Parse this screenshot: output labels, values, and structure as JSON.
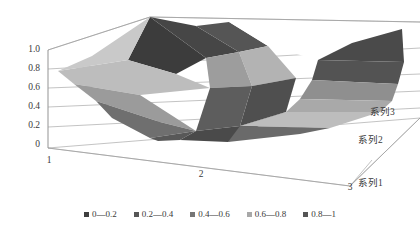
{
  "chart_data": {
    "type": "surface",
    "title": "",
    "xlabel": "",
    "ylabel": "",
    "zlabel": "",
    "grid": true,
    "legend_position": "bottom",
    "categories": [
      "1",
      "2",
      "3"
    ],
    "series_names": [
      "系列1",
      "系列2",
      "系列3"
    ],
    "zlim": [
      0,
      1
    ],
    "z_ticks": [
      "0",
      "0.2",
      "0.4",
      "0.6",
      "0.8",
      "1.0"
    ],
    "series": [
      {
        "name": "系列1",
        "values": [
          0.85,
          0.1,
          0.95
        ]
      },
      {
        "name": "系列2",
        "values": [
          0.8,
          0.55,
          0.45
        ]
      },
      {
        "name": "系列3",
        "values": [
          0.82,
          1.0,
          0.3
        ]
      }
    ],
    "color_bands": [
      {
        "label": "0—0.2",
        "range": [
          0,
          0.2
        ],
        "color": "#404040"
      },
      {
        "label": "0.2—0.4",
        "range": [
          0.2,
          0.4
        ],
        "color": "#595959"
      },
      {
        "label": "0.4—0.6",
        "range": [
          0.4,
          0.6
        ],
        "color": "#7f7f7f"
      },
      {
        "label": "0.6—0.8",
        "range": [
          0.6,
          0.8
        ],
        "color": "#a6a6a6"
      },
      {
        "label": "0.8—1",
        "range": [
          0.8,
          1.0
        ],
        "color": "#595959"
      }
    ]
  },
  "axes": {
    "z_axis": {
      "name": "value-axis",
      "ticks": [
        {
          "label": "1.0",
          "x": 40,
          "y": 52
        },
        {
          "label": "0.8",
          "x": 40,
          "y": 71
        },
        {
          "label": "0.6",
          "x": 40,
          "y": 90
        },
        {
          "label": "0.4",
          "x": 40,
          "y": 109
        },
        {
          "label": "0.2",
          "x": 40,
          "y": 128
        },
        {
          "label": "0",
          "x": 40,
          "y": 147
        }
      ]
    },
    "x_axis": {
      "name": "category-axis",
      "ticks": [
        {
          "label": "1",
          "x": 49,
          "y": 163
        },
        {
          "label": "2",
          "x": 201,
          "y": 177
        },
        {
          "label": "3",
          "x": 350,
          "y": 190
        }
      ]
    },
    "depth_axis": {
      "name": "series-axis",
      "ticks": [
        {
          "label": "系列3",
          "x": 370,
          "y": 115
        },
        {
          "label": "系列2",
          "x": 358,
          "y": 143
        },
        {
          "label": "系列1",
          "x": 358,
          "y": 186
        }
      ]
    }
  },
  "legend": {
    "items": [
      {
        "label": "0—0.2",
        "color": "#3f3f3f"
      },
      {
        "label": "0.2—0.4",
        "color": "#565656"
      },
      {
        "label": "0.4—0.6",
        "color": "#767676"
      },
      {
        "label": "0.6—0.8",
        "color": "#a8a8a8"
      },
      {
        "label": "0.8—1",
        "color": "#555555"
      }
    ]
  },
  "surface_facets": [
    {
      "name": "facet-back-peak-dark",
      "points": "150,17 206,58 176,74 128,60",
      "color": "#3c3c3c"
    },
    {
      "name": "facet-back-peak-dark2",
      "points": "150,17 206,58 239,52 196,26",
      "color": "#464646"
    },
    {
      "name": "facet-back-upper-mid",
      "points": "196,26 239,52 268,46 229,22",
      "color": "#555555"
    },
    {
      "name": "facet-back-right-top",
      "points": "229,22 268,46 318,60 352,43",
      "color": "#ffffff"
    },
    {
      "name": "facet-right-dark-wedge",
      "points": "318,60 352,43 402,29 404,62",
      "color": "#4a4a4a"
    },
    {
      "name": "facet-right-dark-low",
      "points": "318,60 404,62 398,84 312,80",
      "color": "#535353"
    },
    {
      "name": "facet-right-midgray",
      "points": "312,80 398,84 392,101 300,99",
      "color": "#8f8f8f"
    },
    {
      "name": "facet-right-light",
      "points": "300,99 392,101 380,112 286,112",
      "color": "#a9a9a9"
    },
    {
      "name": "facet-center-lightgray",
      "points": "239,52 268,46 296,78 252,86",
      "color": "#b3b3b3"
    },
    {
      "name": "facet-center-midlight",
      "points": "206,58 239,52 252,86 210,88",
      "color": "#9d9d9d"
    },
    {
      "name": "facet-center-darkwedge",
      "points": "252,86 296,78 286,112 240,126",
      "color": "#4f4f4f"
    },
    {
      "name": "facet-center-dark2",
      "points": "210,88 252,86 240,126 196,131",
      "color": "#5d5d5d"
    },
    {
      "name": "facet-left-band-light",
      "points": "58,71 128,60 176,74 210,88 140,95 74,84",
      "color": "#bdbdbd"
    },
    {
      "name": "facet-left-band-mid",
      "points": "74,84 140,95 196,131 160,122 96,101",
      "color": "#9b9b9b"
    },
    {
      "name": "facet-left-band-dark",
      "points": "96,101 160,122 196,131 150,138 112,118",
      "color": "#6f6f6f"
    },
    {
      "name": "facet-left-top-thin",
      "points": "58,71 128,60 150,17 92,56",
      "color": "#c9c9c9"
    },
    {
      "name": "facet-valley-dark",
      "points": "196,131 240,126 286,112 228,142 180,140",
      "color": "#4a4a4a"
    },
    {
      "name": "facet-valley-left",
      "points": "150,138 196,131 180,140 158,141",
      "color": "#585858"
    },
    {
      "name": "facet-lower-right-pale",
      "points": "286,112 380,112 330,128 240,126",
      "color": "#bdbdbd"
    },
    {
      "name": "facet-lower-right-dark",
      "points": "240,126 330,128 300,134 228,142",
      "color": "#6a6a6a"
    }
  ]
}
